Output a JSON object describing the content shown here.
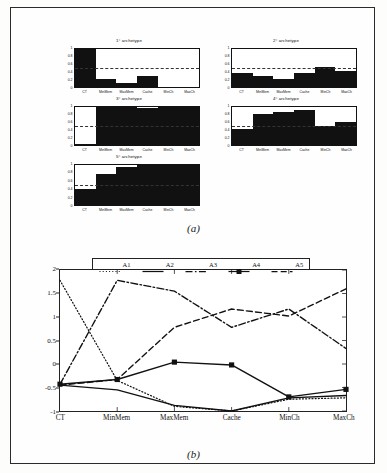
{
  "figure": {
    "panel_a_caption": "(a)",
    "panel_b_caption": "(b)"
  },
  "archetype_charts": {
    "categories": [
      "CT",
      "MinMem",
      "MaxMem",
      "Cache",
      "MinCh",
      "MaxCh"
    ],
    "yticks": [
      "0",
      "0.2",
      "0.4",
      "0.6",
      "0.8",
      "1"
    ],
    "ylim": [
      0,
      1
    ],
    "midline": 0.5,
    "panels": [
      {
        "title": "1° archetype",
        "values": [
          1.0,
          0.22,
          0.1,
          0.28,
          0.0,
          0.01
        ]
      },
      {
        "title": "2° archetype",
        "values": [
          0.37,
          0.3,
          0.2,
          0.37,
          0.52,
          0.43
        ]
      },
      {
        "title": "3° archetype",
        "values": [
          0.02,
          1.0,
          1.0,
          0.98,
          1.0,
          1.0
        ]
      },
      {
        "title": "4° archetype",
        "values": [
          0.42,
          0.82,
          0.88,
          0.92,
          0.5,
          0.6
        ]
      },
      {
        "title": "5° archetype",
        "values": [
          0.4,
          0.78,
          0.95,
          1.0,
          1.0,
          1.0
        ]
      }
    ]
  },
  "chart_data": {
    "type": "line",
    "title": "",
    "xlabel": "",
    "ylabel": "",
    "categories": [
      "CT",
      "MinMem",
      "MaxMem",
      "Cache",
      "MinCh",
      "MaxCh"
    ],
    "ylim": [
      -1,
      2
    ],
    "yticks": [
      2,
      1.5,
      1,
      0.5,
      0,
      -0.5,
      -1
    ],
    "ytick_labels": [
      "2",
      "1.5",
      "1",
      "0.5",
      "0",
      "-0.5",
      "-1"
    ],
    "grid": false,
    "legend_position": "top-center",
    "series": [
      {
        "name": "A1",
        "style": "dotted",
        "values": [
          1.78,
          -0.35,
          -0.9,
          -1.0,
          -0.75,
          -0.72
        ]
      },
      {
        "name": "A2",
        "style": "solid",
        "values": [
          -0.45,
          -0.55,
          -0.88,
          -1.0,
          -0.72,
          -0.67
        ]
      },
      {
        "name": "A3",
        "style": "dashdot",
        "values": [
          -0.43,
          1.78,
          1.55,
          0.78,
          1.17,
          0.33
        ]
      },
      {
        "name": "A4",
        "style": "solid-square",
        "values": [
          -0.43,
          -0.33,
          0.04,
          -0.02,
          -0.7,
          -0.54
        ]
      },
      {
        "name": "A5",
        "style": "dashed",
        "values": [
          -0.45,
          -0.33,
          0.78,
          1.17,
          1.02,
          1.6
        ]
      }
    ]
  },
  "colors": {
    "ink": "#111111",
    "page": "#fefefe",
    "bar_fill": "#111111"
  }
}
